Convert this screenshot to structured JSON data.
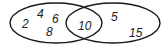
{
  "diagram": {
    "type": "venn",
    "stroke_color": "#1a1a1a",
    "text_color": "#222222",
    "sets": [
      {
        "name": "left-set",
        "only_elements": [
          "2",
          "4",
          "6",
          "8"
        ]
      },
      {
        "name": "right-set",
        "only_elements": [
          "5",
          "15"
        ]
      }
    ],
    "intersection": [
      "10"
    ],
    "labels": {
      "left_2": "2",
      "left_4": "4",
      "left_6": "6",
      "left_8": "8",
      "intersection_10": "10",
      "right_5": "5",
      "right_15": "15"
    }
  }
}
